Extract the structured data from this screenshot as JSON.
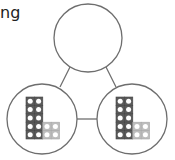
{
  "caption": "ng",
  "diagram": {
    "type": "part-whole-model",
    "whole": {
      "label": "",
      "cx": 88,
      "cy": 38,
      "r": 34
    },
    "parts": [
      {
        "cx": 42,
        "cy": 119,
        "r": 35,
        "blocks": {
          "ten_column": 10,
          "ones": 4
        }
      },
      {
        "cx": 132,
        "cy": 119,
        "r": 35,
        "blocks": {
          "ten_column": 10,
          "ones": 4
        }
      }
    ],
    "colors": {
      "stroke": "#6e6e6e",
      "dark_block": "#5a5a5a",
      "light_block": "#bdbdbd",
      "dot": "#ffffff"
    }
  }
}
